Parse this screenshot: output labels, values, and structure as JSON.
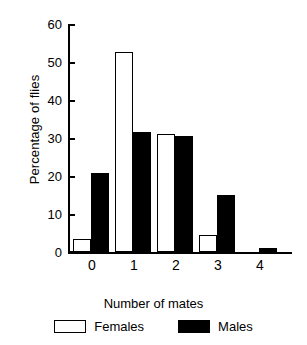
{
  "chart_data": {
    "type": "bar",
    "title": "",
    "xlabel": "Number of mates",
    "ylabel": "Percentage of flies",
    "categories": [
      "0",
      "1",
      "2",
      "3",
      "4"
    ],
    "series": [
      {
        "name": "Females",
        "color": "#ffffff",
        "values": [
          3.5,
          52.6,
          31.0,
          4.5,
          0
        ]
      },
      {
        "name": "Males",
        "color": "#000000",
        "values": [
          20.8,
          31.6,
          30.6,
          15.1,
          1.1
        ]
      }
    ],
    "ylim": [
      0,
      60
    ],
    "yticks": [
      0,
      10,
      20,
      30,
      40,
      50,
      60
    ],
    "ytick_labels": [
      "0",
      "10",
      "20",
      "30",
      "40",
      "50",
      "60"
    ],
    "grid": false,
    "legend_position": "bottom"
  },
  "legend": {
    "entries": [
      {
        "label": "Females",
        "swatch": "open-square-swatch"
      },
      {
        "label": "Males",
        "swatch": "filled-square-swatch"
      }
    ]
  }
}
